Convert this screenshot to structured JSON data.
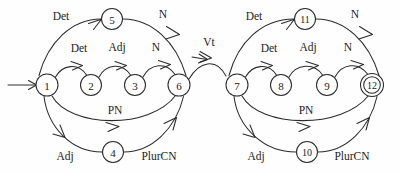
{
  "diagram": {
    "type": "finite-state-automaton",
    "colors": {
      "stroke": "#2a2a2a",
      "background": "#fefefe",
      "text": "#1c1c1c"
    },
    "start_state": "1",
    "accept_states": [
      "12"
    ],
    "nodes": [
      {
        "id": "n1",
        "label": "1",
        "cx": 47,
        "cy": 85,
        "r": 11,
        "accepting": false,
        "start": true
      },
      {
        "id": "n2",
        "label": "2",
        "cx": 91,
        "cy": 85,
        "r": 10.5,
        "accepting": false,
        "start": false
      },
      {
        "id": "n3",
        "label": "3",
        "cx": 135,
        "cy": 85,
        "r": 10.5,
        "accepting": false,
        "start": false
      },
      {
        "id": "n4",
        "label": "4",
        "cx": 113,
        "cy": 152,
        "r": 10.5,
        "accepting": false,
        "start": false
      },
      {
        "id": "n5",
        "label": "5",
        "cx": 112,
        "cy": 19,
        "r": 10.5,
        "accepting": false,
        "start": false
      },
      {
        "id": "n6",
        "label": "6",
        "cx": 179,
        "cy": 85,
        "r": 11,
        "accepting": false,
        "start": false
      },
      {
        "id": "n7",
        "label": "7",
        "cx": 237,
        "cy": 85,
        "r": 11,
        "accepting": false,
        "start": false
      },
      {
        "id": "n8",
        "label": "8",
        "cx": 281,
        "cy": 85,
        "r": 10.5,
        "accepting": false,
        "start": false
      },
      {
        "id": "n9",
        "label": "9",
        "cx": 327,
        "cy": 85,
        "r": 10.5,
        "accepting": false,
        "start": false
      },
      {
        "id": "n10",
        "label": "10",
        "cx": 307,
        "cy": 152,
        "r": 10.5,
        "accepting": false,
        "start": false
      },
      {
        "id": "n11",
        "label": "11",
        "cx": 305,
        "cy": 19,
        "r": 10.5,
        "accepting": false,
        "start": false
      },
      {
        "id": "n12",
        "label": "12",
        "cx": 372,
        "cy": 85,
        "r": 11,
        "accepting": true,
        "start": false
      }
    ],
    "edges": [
      {
        "id": "e1",
        "from": "1",
        "to": "5",
        "label": "Det",
        "label_x": 61,
        "label_y": 16
      },
      {
        "id": "e2",
        "from": "5",
        "to": "6",
        "label": "N",
        "label_x": 163,
        "label_y": 14
      },
      {
        "id": "e3",
        "from": "1",
        "to": "2",
        "label": "Det",
        "label_x": 79,
        "label_y": 48
      },
      {
        "id": "e4",
        "from": "2",
        "to": "3",
        "label": "Adj",
        "label_x": 117,
        "label_y": 47
      },
      {
        "id": "e5",
        "from": "3",
        "to": "6",
        "label": "N",
        "label_x": 156,
        "label_y": 47
      },
      {
        "id": "e6",
        "from": "1",
        "to": "6",
        "label": "PN",
        "label_x": 115,
        "label_y": 110
      },
      {
        "id": "e7",
        "from": "1",
        "to": "4",
        "label": "Adj",
        "label_x": 65,
        "label_y": 156
      },
      {
        "id": "e8",
        "from": "4",
        "to": "6",
        "label": "PlurCN",
        "label_x": 159,
        "label_y": 156
      },
      {
        "id": "e9",
        "from": "6",
        "to": "7",
        "label": "Vt",
        "label_x": 209,
        "label_y": 42
      },
      {
        "id": "e10",
        "from": "7",
        "to": "11",
        "label": "Det",
        "label_x": 254,
        "label_y": 16
      },
      {
        "id": "e11",
        "from": "11",
        "to": "12",
        "label": "N",
        "label_x": 355,
        "label_y": 14
      },
      {
        "id": "e12",
        "from": "7",
        "to": "8",
        "label": "Det",
        "label_x": 269,
        "label_y": 48
      },
      {
        "id": "e13",
        "from": "8",
        "to": "9",
        "label": "Adj",
        "label_x": 308,
        "label_y": 47
      },
      {
        "id": "e14",
        "from": "9",
        "to": "12",
        "label": "N",
        "label_x": 348,
        "label_y": 47
      },
      {
        "id": "e15",
        "from": "7",
        "to": "12",
        "label": "PN",
        "label_x": 306,
        "label_y": 110
      },
      {
        "id": "e16",
        "from": "7",
        "to": "10",
        "label": "Adj",
        "label_x": 256,
        "label_y": 156
      },
      {
        "id": "e17",
        "from": "10",
        "to": "12",
        "label": "PlurCN",
        "label_x": 352,
        "label_y": 156
      }
    ]
  }
}
